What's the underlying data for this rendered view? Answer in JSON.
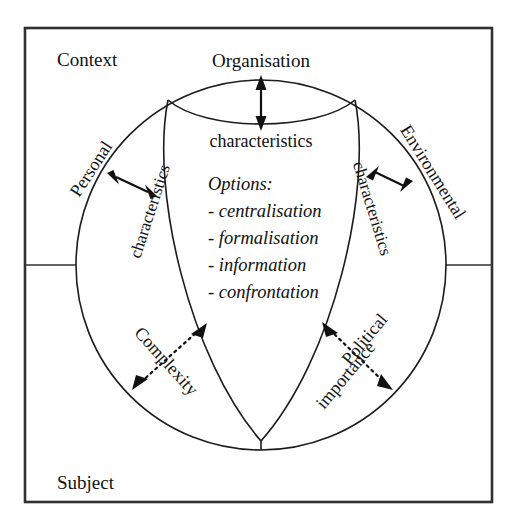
{
  "figure": {
    "type": "conceptual-diagram",
    "shape": "circle-divided-into-four-lens-segments",
    "frame_label_top": "Context",
    "frame_label_bottom": "Subject"
  },
  "frame": {
    "context_label": "Context",
    "subject_label": "Subject"
  },
  "nodes": {
    "organisation": {
      "title": "Organisation",
      "subtitle": "characteristics"
    },
    "personal": {
      "title": "Personal",
      "subtitle": "characteristics"
    },
    "environmental": {
      "title": "Environmental",
      "subtitle": "characteristics"
    }
  },
  "options": {
    "heading": "Options:",
    "items": [
      "- centralisation",
      "- formalisation",
      "- information",
      "- confrontation"
    ]
  },
  "dimensions": {
    "complexity": {
      "label": "Complexity",
      "arrow_style": "dotted-double"
    },
    "political_importance": {
      "line1": "Political",
      "line2": "importance",
      "arrow_style": "dotted-double"
    }
  },
  "connectors": [
    {
      "name": "organisation-arrow",
      "style": "solid-double",
      "orientation": "vertical"
    },
    {
      "name": "personal-arrow",
      "style": "solid-double",
      "orientation": "diagonal"
    },
    {
      "name": "environmental-arrow",
      "style": "solid-double",
      "orientation": "diagonal"
    },
    {
      "name": "complexity-arrow",
      "style": "dotted-double",
      "orientation": "diagonal"
    },
    {
      "name": "political-importance-arrow",
      "style": "dotted-double",
      "orientation": "diagonal"
    }
  ],
  "colors": {
    "ink": "#111111",
    "frame": "#303030",
    "background": "#ffffff"
  }
}
